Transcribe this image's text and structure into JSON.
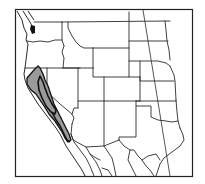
{
  "map": {
    "title": "Species range map — western United States",
    "region": "Western United States",
    "projection_note": "Inset outline map with state boundaries and a diagonal meridian line",
    "states_shown": [
      "Washington",
      "Oregon",
      "California",
      "Idaho",
      "Nevada",
      "Utah",
      "Arizona",
      "Montana",
      "Wyoming",
      "Colorado",
      "New Mexico",
      "North Dakota",
      "South Dakota",
      "Nebraska",
      "Kansas",
      "Oklahoma",
      "Texas"
    ],
    "range": {
      "location": "California — Coast Ranges and Central Valley margins, north to southern Oregon border area",
      "fill_color": "#9a9a9a",
      "outline_color": "#111111"
    },
    "colors": {
      "background": "#ffffff",
      "lines": "#2a2a2a",
      "range_fill": "#9a9a9a"
    }
  }
}
